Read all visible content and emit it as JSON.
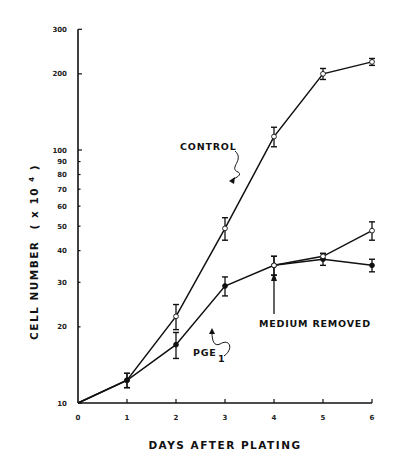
{
  "chart_data": {
    "type": "line",
    "title": "",
    "xlabel": "DAYS AFTER PLATING",
    "ylabel": "CELL NUMBER ( x10^4 )",
    "ylabel_main": "CELL NUMBER",
    "ylabel_unit_prefix": "( x 10",
    "ylabel_unit_exp": "4",
    "ylabel_unit_suffix": " )",
    "yscale": "log",
    "ylim": [
      10,
      300
    ],
    "xlim": [
      0,
      6
    ],
    "grid": false,
    "x": [
      0,
      1,
      2,
      3,
      4,
      5,
      6
    ],
    "xticks": [
      "0",
      "1",
      "2",
      "3",
      "4",
      "5",
      "6"
    ],
    "yticks": [
      10,
      20,
      30,
      40,
      50,
      60,
      70,
      80,
      90,
      100,
      200,
      300
    ],
    "ytick_labels": [
      "10",
      "20",
      "30",
      "40",
      "50",
      "60",
      "70",
      "80",
      "90",
      "100",
      "200",
      "300"
    ],
    "series": [
      {
        "name": "CONTROL",
        "marker": "open-circle",
        "x": [
          0,
          1,
          2,
          3,
          4,
          5,
          6
        ],
        "values": [
          10,
          12.3,
          22,
          49,
          113,
          200,
          223
        ],
        "err": [
          0,
          0.8,
          2.5,
          5,
          10,
          10,
          7
        ]
      },
      {
        "name": "PGE1",
        "marker": "filled-circle",
        "x": [
          0,
          1,
          2,
          3,
          4,
          5,
          6
        ],
        "values": [
          10,
          12.3,
          17,
          29,
          35,
          37,
          35
        ],
        "err": [
          0,
          0.8,
          2.0,
          2.5,
          3,
          2,
          2
        ]
      },
      {
        "name": "CONTROL (medium removed)",
        "marker": "open-circle",
        "x": [
          4,
          5,
          6
        ],
        "values": [
          35,
          38,
          48
        ],
        "err": [
          3,
          1,
          4
        ]
      }
    ],
    "annotations": [
      {
        "text": "CONTROL",
        "x": 2.6,
        "y": 130
      },
      {
        "text": "PGE",
        "subscript": "1",
        "x": 2.4,
        "y": 17
      },
      {
        "text": "MEDIUM REMOVED",
        "arrow_to_day": 4,
        "y": 24
      }
    ]
  }
}
